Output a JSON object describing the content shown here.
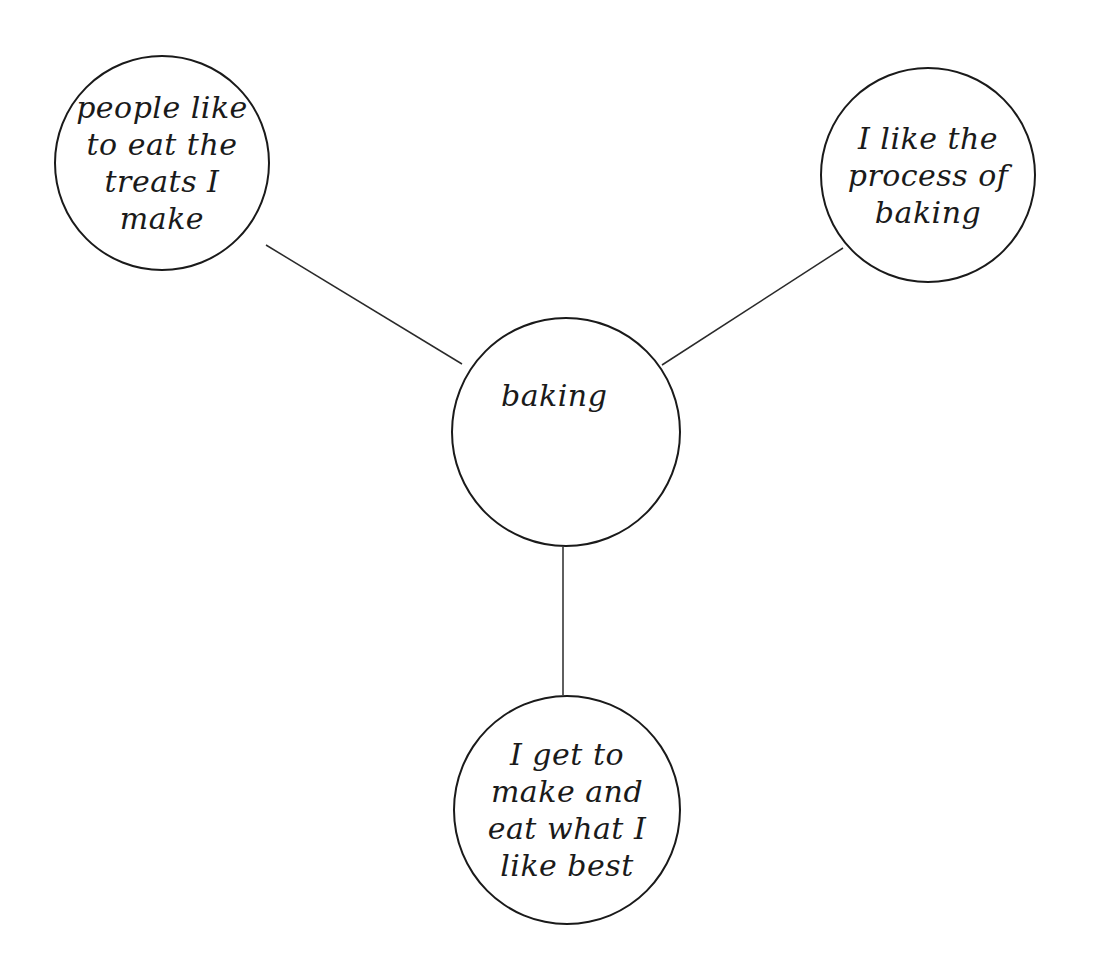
{
  "diagram": {
    "type": "mind-map",
    "central_node": {
      "label": "baking",
      "cx": 566,
      "cy": 432,
      "r": 115
    },
    "branches": [
      {
        "id": "top-left",
        "label": "people like\nto eat the\ntreats I\nmake",
        "cx": 162,
        "cy": 163,
        "r": 108,
        "connector": {
          "x1": 266,
          "y1": 245,
          "x2": 462,
          "y2": 364
        }
      },
      {
        "id": "top-right",
        "label": "I like the\nprocess of\nbaking",
        "cx": 928,
        "cy": 175,
        "r": 108,
        "connector": {
          "x1": 843,
          "y1": 248,
          "x2": 662,
          "y2": 365
        }
      },
      {
        "id": "bottom",
        "label": "I get to\nmake and\neat what I\nlike best",
        "cx": 566,
        "cy": 810,
        "r": 115,
        "connector": {
          "x1": 563,
          "y1": 547,
          "x2": 563,
          "y2": 695
        }
      }
    ],
    "colors": {
      "stroke": "#1a1a1a",
      "background": "#ffffff"
    }
  }
}
